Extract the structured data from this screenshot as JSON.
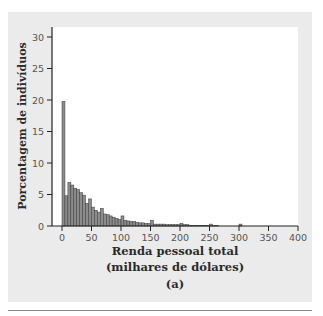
{
  "chart_data": {
    "type": "bar",
    "subtype": "histogram",
    "title": "",
    "xlabel": "Renda pessoal total (milhares de dólares)",
    "ylabel": "Porcentagem de indivíduos",
    "caption": "(a)",
    "xlim": [
      0,
      400
    ],
    "ylim": [
      0,
      30
    ],
    "bin_width": 5,
    "x_ticks": [
      0,
      50,
      100,
      150,
      200,
      250,
      300,
      350,
      400
    ],
    "y_ticks": [
      0,
      5,
      10,
      15,
      20,
      25,
      30
    ],
    "grid": false,
    "bins_start": [
      0,
      5,
      10,
      15,
      20,
      25,
      30,
      35,
      40,
      45,
      50,
      55,
      60,
      65,
      70,
      75,
      80,
      85,
      90,
      95,
      100,
      105,
      110,
      115,
      120,
      125,
      130,
      135,
      140,
      145,
      150,
      155,
      160,
      165,
      170,
      175,
      180,
      185,
      190,
      195,
      200,
      205,
      210,
      215,
      220,
      225,
      230,
      235,
      240,
      245,
      250,
      255,
      260,
      265,
      270,
      275,
      280,
      285,
      290,
      295,
      300
    ],
    "values": [
      19.8,
      4.8,
      6.9,
      6.5,
      6.0,
      5.8,
      5.3,
      4.9,
      3.6,
      4.3,
      3.0,
      2.5,
      2.2,
      2.8,
      1.9,
      1.8,
      1.6,
      1.4,
      1.2,
      1.0,
      1.6,
      0.9,
      0.8,
      0.7,
      0.7,
      0.6,
      0.5,
      0.5,
      0.4,
      0.4,
      0.9,
      0.3,
      0.3,
      0.3,
      0.3,
      0.2,
      0.2,
      0.2,
      0.2,
      0.2,
      0.4,
      0.2,
      0.2,
      0.1,
      0.1,
      0.1,
      0.1,
      0.1,
      0.1,
      0.1,
      0.3,
      0.1,
      0.1,
      0.0,
      0.0,
      0.0,
      0.0,
      0.0,
      0.0,
      0.0,
      0.3
    ],
    "bar_color": "#8c8c8c",
    "bar_edge": "#3a3a3a"
  },
  "labels": {
    "ylabel": "Porcentagem de indivíduos",
    "xlabel_line1": "Renda pessoal total",
    "xlabel_line2": "(milhares de dólares)",
    "caption": "(a)"
  }
}
